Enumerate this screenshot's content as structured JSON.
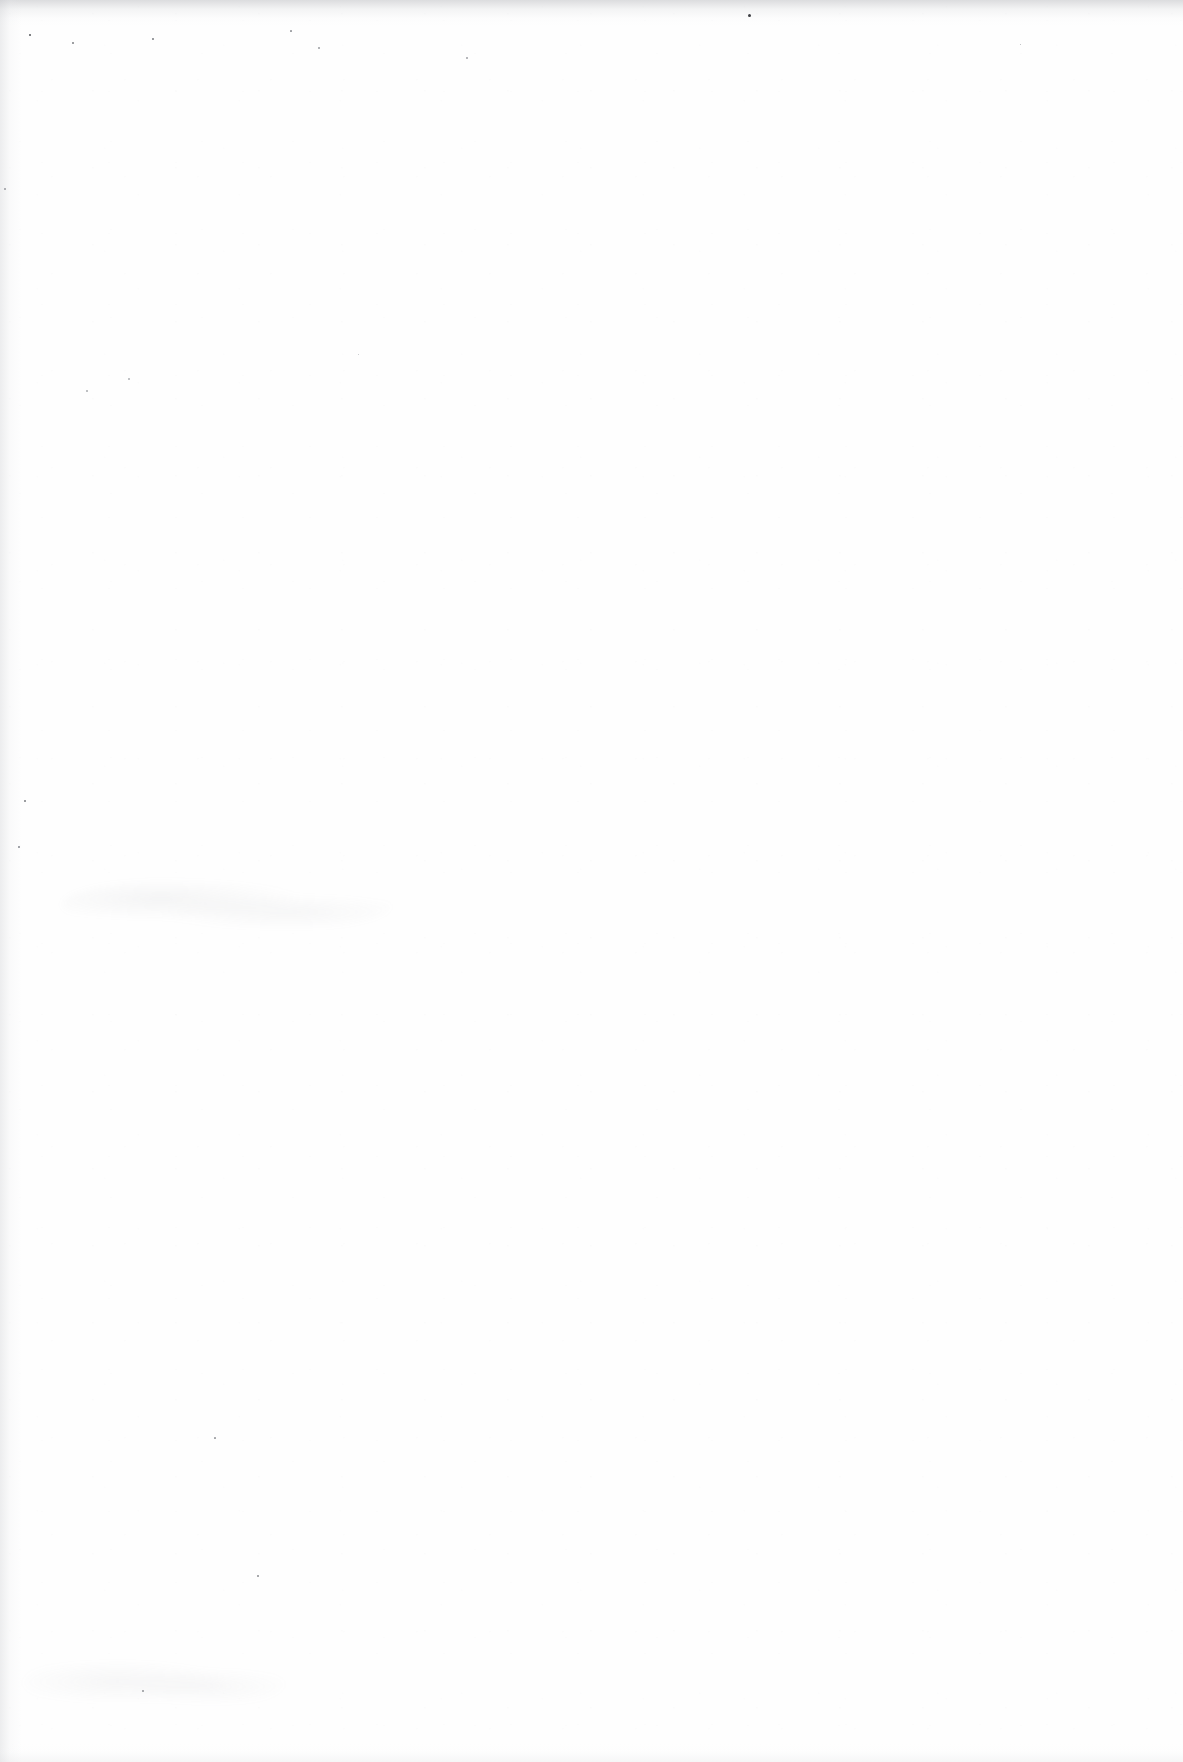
{
  "page": {
    "kind": "blank-scanned-page",
    "width_px": 1183,
    "height_px": 1762,
    "background_color": "#ffffff",
    "paper_color": "#fefefe",
    "text_content": "",
    "visible_text_blocks": []
  },
  "scan_artifacts": {
    "edge_shading": [
      {
        "name": "top-edge-shading",
        "position": "top",
        "tone": "#a8aaae"
      },
      {
        "name": "left-edge-shading",
        "position": "left",
        "tone": "#c4c6ca"
      },
      {
        "name": "bottom-edge-shading",
        "position": "bottom",
        "tone": "#dedfe2"
      }
    ],
    "smudge_bands": [
      {
        "name": "upper-smudge-band",
        "x": 62,
        "y": 876,
        "width": 330,
        "height": 58,
        "tone": "#8e9096",
        "legible": false
      },
      {
        "name": "lower-smudge-band",
        "x": 24,
        "y": 1652,
        "width": 260,
        "height": 62,
        "tone": "#94969c",
        "legible": false
      }
    ],
    "dust_specks": [
      {
        "x": 748,
        "y": 14,
        "size": 3.0,
        "tone": "#3c3e42"
      },
      {
        "x": 29,
        "y": 34,
        "size": 2.4,
        "tone": "#55575b"
      },
      {
        "x": 152,
        "y": 38,
        "size": 1.8,
        "tone": "#7d7f84"
      },
      {
        "x": 72,
        "y": 42,
        "size": 1.6,
        "tone": "#8a8c90"
      },
      {
        "x": 290,
        "y": 30,
        "size": 1.7,
        "tone": "#9a9ca0"
      },
      {
        "x": 318,
        "y": 47,
        "size": 1.5,
        "tone": "#a4a6aa"
      },
      {
        "x": 466,
        "y": 57,
        "size": 1.5,
        "tone": "#a8aaae"
      },
      {
        "x": 1020,
        "y": 44,
        "size": 1.4,
        "tone": "#b0b2b6"
      },
      {
        "x": 4,
        "y": 188,
        "size": 1.6,
        "tone": "#a0a2a6"
      },
      {
        "x": 86,
        "y": 390,
        "size": 1.5,
        "tone": "#b2b4b8"
      },
      {
        "x": 128,
        "y": 378,
        "size": 1.5,
        "tone": "#b6b8bc"
      },
      {
        "x": 358,
        "y": 354,
        "size": 1.4,
        "tone": "#bcbec2"
      },
      {
        "x": 24,
        "y": 800,
        "size": 2.0,
        "tone": "#7a7c80"
      },
      {
        "x": 18,
        "y": 846,
        "size": 1.8,
        "tone": "#868890"
      },
      {
        "x": 214,
        "y": 1437,
        "size": 1.7,
        "tone": "#9ea0a4"
      },
      {
        "x": 257,
        "y": 1575,
        "size": 1.9,
        "tone": "#8c8e92"
      },
      {
        "x": 142,
        "y": 1690,
        "size": 1.6,
        "tone": "#9c9ea2"
      }
    ]
  }
}
